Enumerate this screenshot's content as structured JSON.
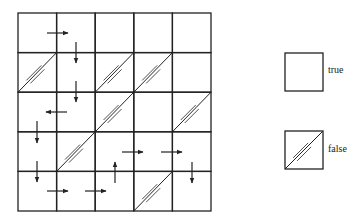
{
  "grid": {
    "rows": 5,
    "cols": 5,
    "origin": [
      18,
      13
    ],
    "cell_w": 38.6,
    "cell_h": 39.6,
    "cells": [
      [
        "true",
        "true",
        "true",
        "true",
        "true"
      ],
      [
        "false",
        "true",
        "false",
        "false",
        "true"
      ],
      [
        "true",
        "true",
        "false",
        "true",
        "false"
      ],
      [
        "true",
        "false",
        "true",
        "true",
        "true"
      ],
      [
        "true",
        "true",
        "true",
        "false",
        "true"
      ]
    ],
    "arrows": [
      {
        "dir": "right",
        "x1": 47,
        "y1": 33,
        "x2": 68,
        "y2": 33
      },
      {
        "dir": "down",
        "x1": 76,
        "y1": 42,
        "x2": 76,
        "y2": 63
      },
      {
        "dir": "down",
        "x1": 76,
        "y1": 81,
        "x2": 76,
        "y2": 102
      },
      {
        "dir": "left",
        "x1": 67,
        "y1": 112,
        "x2": 46,
        "y2": 112
      },
      {
        "dir": "down",
        "x1": 37,
        "y1": 121,
        "x2": 37,
        "y2": 143
      },
      {
        "dir": "right",
        "x1": 122,
        "y1": 152,
        "x2": 143,
        "y2": 152
      },
      {
        "dir": "right",
        "x1": 161,
        "y1": 152,
        "x2": 182,
        "y2": 152
      },
      {
        "dir": "down",
        "x1": 37,
        "y1": 161,
        "x2": 37,
        "y2": 182
      },
      {
        "dir": "up",
        "x1": 115,
        "y1": 183,
        "x2": 115,
        "y2": 162
      },
      {
        "dir": "down",
        "x1": 192,
        "y1": 162,
        "x2": 192,
        "y2": 183
      },
      {
        "dir": "right",
        "x1": 47,
        "y1": 191,
        "x2": 68,
        "y2": 191
      },
      {
        "dir": "right",
        "x1": 85,
        "y1": 191,
        "x2": 106,
        "y2": 191
      }
    ]
  },
  "legend": {
    "items": [
      {
        "label": "true",
        "state": "true",
        "box": [
          285,
          53,
          38,
          38
        ]
      },
      {
        "label": "false",
        "state": "false",
        "box": [
          285,
          131,
          38,
          38
        ]
      }
    ]
  },
  "colors": {
    "line": "#222222",
    "background": "#ffffff"
  }
}
